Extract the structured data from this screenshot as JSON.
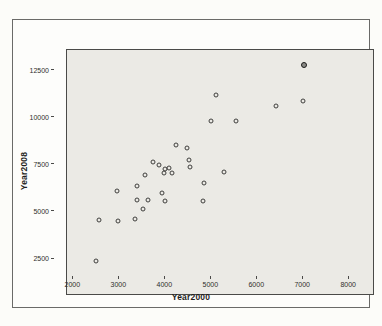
{
  "chart_data": {
    "type": "scatter",
    "title": "",
    "xlabel": "Year2000",
    "ylabel": "Year2008",
    "xlim": [
      1600,
      8300
    ],
    "ylim": [
      1550,
      14600
    ],
    "x_ticks": [
      2000,
      3000,
      4000,
      5000,
      6000,
      7000,
      8000
    ],
    "y_ticks": [
      2500,
      5000,
      7500,
      10000,
      12500
    ],
    "grid": false,
    "legend_position": "none",
    "marker": "open-circle",
    "points": [
      [
        2240,
        3310
      ],
      [
        2300,
        5500
      ],
      [
        2720,
        5450
      ],
      [
        3080,
        5580
      ],
      [
        2690,
        7040
      ],
      [
        3140,
        7350
      ],
      [
        3300,
        7890
      ],
      [
        3260,
        6070
      ],
      [
        3140,
        6560
      ],
      [
        3370,
        6560
      ],
      [
        3490,
        8620
      ],
      [
        3610,
        8460
      ],
      [
        3750,
        8250
      ],
      [
        3830,
        8280
      ],
      [
        3730,
        8040
      ],
      [
        3900,
        8010
      ],
      [
        3690,
        6940
      ],
      [
        3740,
        6500
      ],
      [
        4270,
        8730
      ],
      [
        4300,
        8340
      ],
      [
        3990,
        9540
      ],
      [
        4230,
        9360
      ],
      [
        4590,
        7500
      ],
      [
        4580,
        6520
      ],
      [
        5030,
        8090
      ],
      [
        4870,
        12200
      ],
      [
        4760,
        10780
      ],
      [
        5300,
        10820
      ],
      [
        6170,
        11620
      ],
      [
        6760,
        11870
      ]
    ],
    "overlapped_point": [
      6800,
      13810
    ]
  },
  "colors": {
    "plot_background": "#ebeae5",
    "frame_border": "#4a4a48",
    "marker_stroke": "#3f3f3d",
    "page_background": "#fcfcf9"
  }
}
